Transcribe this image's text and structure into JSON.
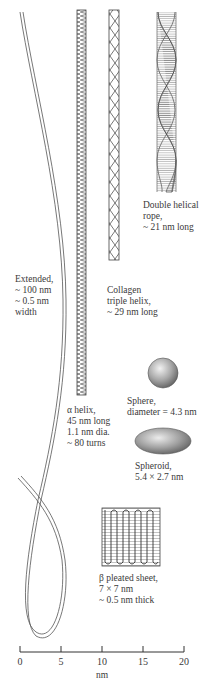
{
  "structures": {
    "extended": {
      "lines": [
        "Extended,",
        "~ 100 nm",
        "~ 0.5 nm",
        "width"
      ]
    },
    "alpha_helix": {
      "lines": [
        "α helix,",
        "45 nm long",
        "1.1 nm dia.",
        "~ 80 turns"
      ]
    },
    "collagen": {
      "lines": [
        "Collagen",
        "triple helix,",
        "~ 29 nm long"
      ]
    },
    "double_helix": {
      "lines": [
        "Double helical",
        "rope,",
        "~ 21 nm long"
      ]
    },
    "sphere": {
      "lines": [
        "Sphere,",
        "diameter = 4.3 nm"
      ]
    },
    "spheroid": {
      "lines": [
        "Spheroid,",
        "5.4 × 2.7 nm"
      ]
    },
    "beta_sheet": {
      "lines": [
        "β pleated sheet,",
        "7 × 7 nm",
        "~ 0.5 nm thick"
      ]
    }
  },
  "scale_bar": {
    "ticks": [
      "0",
      "5",
      "10",
      "15",
      "20"
    ],
    "unit": "nm"
  },
  "colors": {
    "line": "#555555",
    "sphere_light": "#e8e8e8",
    "sphere_dark": "#6e6e6e"
  }
}
